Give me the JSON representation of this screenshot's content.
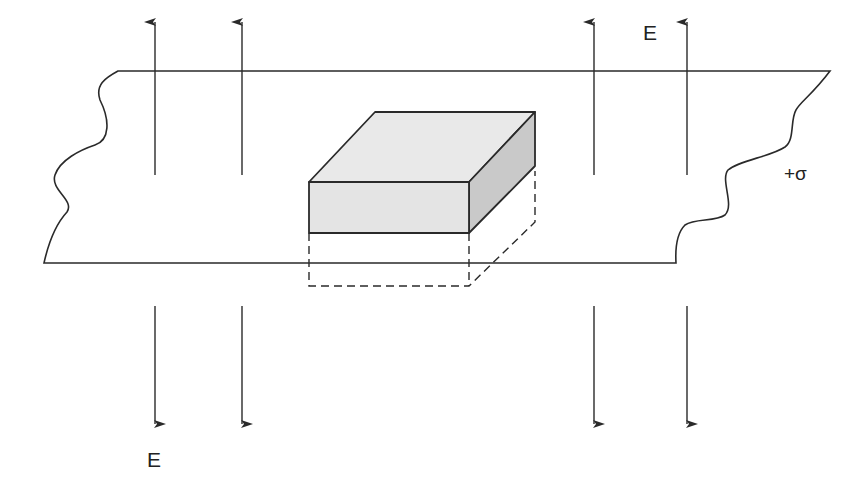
{
  "diagram": {
    "type": "gaussian-pillbox-on-charged-sheet",
    "labels": {
      "field_top": "E",
      "field_bottom": "E",
      "surface_charge": "+σ"
    },
    "colors": {
      "line": "#2a2a2a",
      "box_front": "#e4e4e4",
      "box_top": "#e9e9e9",
      "box_side": "#c9c9c9",
      "background": "#ffffff"
    },
    "field_lines_up_x": [
      155,
      242,
      594,
      687
    ],
    "field_lines_down_x": [
      155,
      242,
      594,
      687
    ]
  }
}
